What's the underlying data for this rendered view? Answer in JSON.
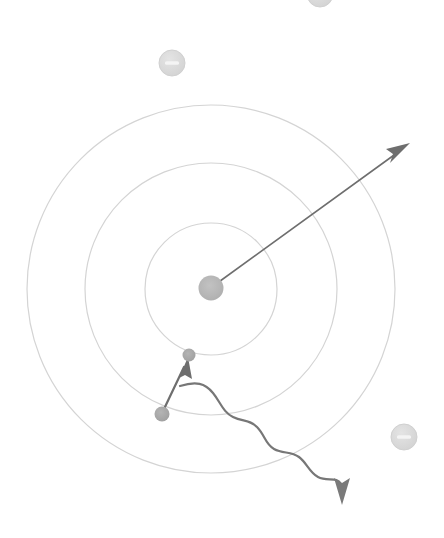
{
  "canvas": {
    "width": 444,
    "height": 538,
    "background": "#ffffff",
    "title": "Bohr atom electron transition and photon emission diagram"
  },
  "colors": {
    "orbit_stroke": "#d4d4d4",
    "nucleus_fill": "#b5b5b5",
    "electron_fill": "#a8a8a8",
    "free_electron_fill": "#dcdcdc",
    "free_electron_stroke": "#d0d0d0",
    "free_electron_sign": "#f2f2f2",
    "arrow_stroke": "#6e6e6e",
    "photon_stroke": "#777777"
  },
  "nucleus": {
    "label": "nucleus",
    "cx": 211,
    "cy": 288,
    "r": 12.5,
    "fill": "#b5b5b5"
  },
  "orbits": [
    {
      "label": "orbit-1-inner",
      "cx": 211,
      "cy": 289,
      "r": 66,
      "stroke": "#d4d4d4",
      "stroke_width": 1.2
    },
    {
      "label": "orbit-2-middle",
      "cx": 211,
      "cy": 289,
      "r": 126,
      "stroke": "#d4d4d4",
      "stroke_width": 1.2
    },
    {
      "label": "orbit-3-outer",
      "cx": 211,
      "cy": 289,
      "r": 184,
      "stroke": "#d4d4d4",
      "stroke_width": 1.2
    }
  ],
  "bound_electrons": [
    {
      "label": "electron-upper-orbit-1",
      "cx": 189,
      "cy": 355,
      "r": 6.5,
      "fill": "#a8a8a8"
    },
    {
      "label": "electron-lower-orbit-2",
      "cx": 162,
      "cy": 414,
      "r": 7.5,
      "fill": "#a8a8a8"
    }
  ],
  "free_electrons": [
    {
      "label": "free-electron-top-partial",
      "cx": 320,
      "cy": -6,
      "r": 13,
      "sign": "minus"
    },
    {
      "label": "free-electron-upper-left",
      "cx": 172,
      "cy": 63,
      "r": 13,
      "sign": "minus"
    },
    {
      "label": "free-electron-lower-right",
      "cx": 404,
      "cy": 437,
      "r": 13,
      "sign": "minus"
    }
  ],
  "arrows": {
    "nucleus_ray": {
      "label": "nucleus-outward-arrow",
      "x1": 216,
      "y1": 284,
      "x2": 403,
      "y2": 148,
      "head_tip_x": 410,
      "head_tip_y": 143,
      "stroke_width": 1.6
    },
    "transition": {
      "label": "electron-transition-arrow",
      "x1": 164,
      "y1": 409,
      "x2": 186,
      "y2": 362,
      "head_tip_x": 188,
      "head_tip_y": 357,
      "stroke_width": 2.2
    },
    "photon_head": {
      "label": "photon-emission-arrowhead",
      "tip_x": 342,
      "tip_y": 505
    }
  },
  "photon_wave": {
    "label": "emitted-photon-wave",
    "start_x": 180,
    "start_y": 386,
    "end_x": 342,
    "end_y": 482,
    "stroke_width": 2.2,
    "path": "M180,386 C196,381 205,383 213,393 C221,403 223,412 233,417 C243,422 249,419 257,427 C265,435 265,444 274,449 C283,454 291,451 299,457 C307,463 309,472 318,477 C327,482 336,477 342,482"
  },
  "legend": {
    "diagram_type": "atomic-model",
    "description": "Concentric electron shells around a nucleus with an electron transition and an emitted photon"
  }
}
